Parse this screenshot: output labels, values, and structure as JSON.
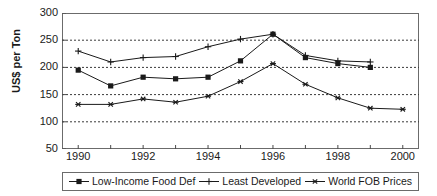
{
  "chart_data": {
    "type": "line",
    "title": "",
    "xlabel": "",
    "ylabel": "US$ per Ton",
    "xlim": [
      1989.5,
      2000.5
    ],
    "ylim": [
      50,
      300
    ],
    "ytick_values": [
      300,
      250,
      200,
      150,
      100,
      50
    ],
    "ytick_labels": [
      "300",
      "250",
      "200",
      "150",
      "100",
      "50"
    ],
    "xtick_values": [
      1990,
      1992,
      1994,
      1996,
      1998,
      2000
    ],
    "xtick_labels": [
      "1990",
      "1992",
      "1994",
      "1996",
      "1998",
      "2000"
    ],
    "x_minor_ticks": [
      1991,
      1993,
      1995,
      1997,
      1999
    ],
    "grid": "horizontal-dotted",
    "legend_position": "below",
    "series": [
      {
        "name": "Low-Income Food Def",
        "marker": "square",
        "color": "#1a1a1a",
        "x": [
          1990,
          1991,
          1992,
          1993,
          1994,
          1995,
          1996,
          1997,
          1998,
          1999
        ],
        "values": [
          195,
          166,
          182,
          179,
          182,
          212,
          261,
          218,
          207,
          200
        ]
      },
      {
        "name": "Least Developed",
        "marker": "plus",
        "color": "#1a1a1a",
        "x": [
          1990,
          1991,
          1992,
          1993,
          1994,
          1995,
          1996,
          1997,
          1998,
          1999
        ],
        "values": [
          230,
          210,
          218,
          220,
          238,
          252,
          261,
          222,
          212,
          210
        ]
      },
      {
        "name": "World FOB Prices",
        "marker": "asterisk",
        "color": "#1a1a1a",
        "x": [
          1990,
          1991,
          1992,
          1993,
          1994,
          1995,
          1996,
          1997,
          1998,
          1999,
          2000
        ],
        "values": [
          132,
          132,
          142,
          136,
          147,
          174,
          207,
          169,
          144,
          125,
          123
        ]
      }
    ]
  },
  "legend": {
    "items": [
      {
        "label": "Low-Income Food Def",
        "marker": "square"
      },
      {
        "label": "Least Developed",
        "marker": "plus"
      },
      {
        "label": "World FOB Prices",
        "marker": "asterisk"
      }
    ]
  }
}
